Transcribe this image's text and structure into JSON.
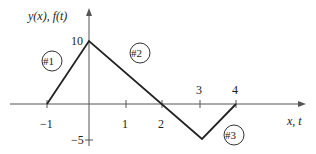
{
  "diagram": {
    "y_axis_label": "y(x), f(t)",
    "x_axis_label": "x, t",
    "x_ticks": [
      {
        "value": -1,
        "label": "−1"
      },
      {
        "value": 1,
        "label": "1"
      },
      {
        "value": 2,
        "label": "2"
      },
      {
        "value": 3,
        "label": "3"
      },
      {
        "value": 4,
        "label": "4"
      }
    ],
    "y_ticks": [
      {
        "value": 10,
        "label": "10"
      },
      {
        "value": -5,
        "label": "−5"
      }
    ],
    "segments": [
      {
        "id": "#1",
        "from": [
          -1,
          0
        ],
        "to": [
          0,
          10
        ]
      },
      {
        "id": "#2",
        "from": [
          0,
          10
        ],
        "to": [
          3,
          -5
        ]
      },
      {
        "id": "#3",
        "from": [
          3,
          -5
        ],
        "to": [
          4,
          0
        ]
      }
    ],
    "segment_labels": [
      "#1",
      "#2",
      "#3"
    ],
    "colors": {
      "line": "#222222",
      "axis": "#555555"
    }
  }
}
